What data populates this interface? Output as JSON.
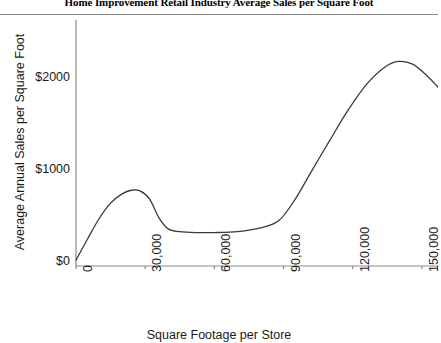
{
  "chart_data": {
    "type": "line",
    "title": "Home Improvement Retail Industry Average Sales per Square Foot",
    "xlabel": "Square Footage per Store",
    "ylabel": "Average Annual Sales per Square Foot",
    "xlim": [
      0,
      157000
    ],
    "ylim": [
      0,
      2400
    ],
    "grid": false,
    "legend": false,
    "x_ticks": [
      {
        "value": 0,
        "label": "0"
      },
      {
        "value": 30000,
        "label": "30,000"
      },
      {
        "value": 60000,
        "label": "60,000"
      },
      {
        "value": 90000,
        "label": "90,000"
      },
      {
        "value": 120000,
        "label": "120,000"
      },
      {
        "value": 150000,
        "label": "150,000"
      }
    ],
    "y_ticks": [
      {
        "value": 0,
        "label": "$0"
      },
      {
        "value": 1000,
        "label": "$1000"
      },
      {
        "value": 2000,
        "label": "$2000"
      }
    ],
    "series": [
      {
        "name": "Average sales per square foot",
        "color": "#3a3a3a",
        "x": [
          0,
          5000,
          10000,
          15000,
          20000,
          24000,
          28000,
          32000,
          36000,
          40000,
          45000,
          52000,
          60000,
          70000,
          80000,
          88000,
          95000,
          102000,
          110000,
          118000,
          126000,
          134000,
          140000,
          146000,
          152000,
          157000
        ],
        "y": [
          20,
          250,
          470,
          640,
          740,
          780,
          770,
          680,
          480,
          360,
          330,
          320,
          320,
          330,
          370,
          450,
          680,
          980,
          1320,
          1650,
          1930,
          2120,
          2180,
          2150,
          2030,
          1900
        ]
      }
    ]
  }
}
